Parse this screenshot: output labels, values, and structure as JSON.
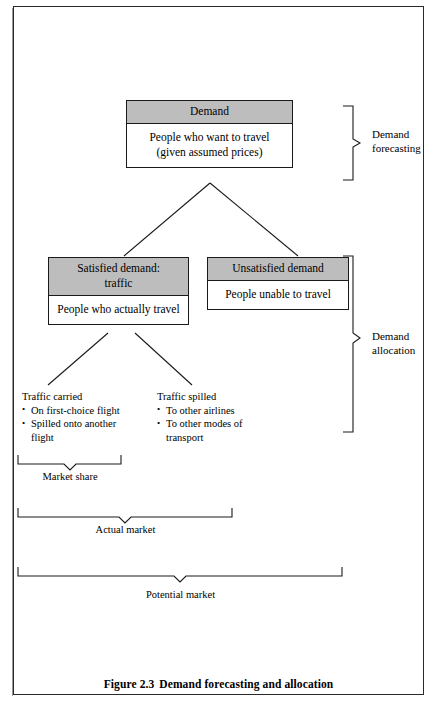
{
  "figure": {
    "caption_number": "Figure 2.3",
    "caption_title": "Demand forecasting and allocation"
  },
  "nodes": {
    "demand": {
      "header": "Demand",
      "body_line1": "People who want to travel",
      "body_line2": "(given assumed prices)"
    },
    "satisfied": {
      "header_line1": "Satisfied demand:",
      "header_line2": "traffic",
      "body": "People who actually travel"
    },
    "unsatisfied": {
      "header": "Unsatisfied demand",
      "body": "People unable to travel"
    }
  },
  "leaves": {
    "traffic_carried": {
      "title": "Traffic carried",
      "bullets": [
        "On first-choice flight",
        "Spilled onto another flight"
      ]
    },
    "traffic_spilled": {
      "title": "Traffic spilled",
      "bullets": [
        "To other airlines",
        "To other modes of transport"
      ]
    }
  },
  "side_brackets": {
    "forecasting_line1": "Demand",
    "forecasting_line2": "forecasting",
    "allocation_line1": "Demand",
    "allocation_line2": "allocation"
  },
  "bottom_braces": {
    "market_share": "Market share",
    "actual_market": "Actual market",
    "potential_market": "Potential market"
  },
  "colors": {
    "header_fill": "#bdbdbd",
    "line": "#1a1a1a",
    "frame": "#2a2a2a",
    "background": "#ffffff"
  }
}
